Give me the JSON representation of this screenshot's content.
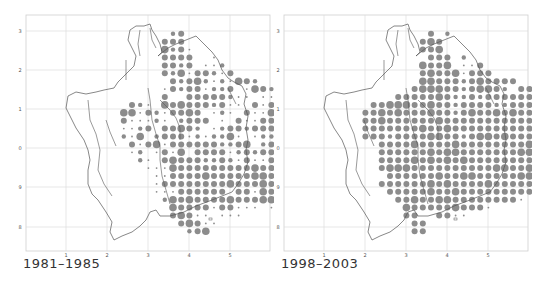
{
  "maps": [
    {
      "caption": "1981–1985",
      "x_ticks": [
        "1",
        "2",
        "3",
        "4",
        "5"
      ],
      "y_ticks": [
        "3",
        "2",
        "1",
        "0",
        "9",
        "8"
      ],
      "rows": [
        "00000000000000000000000000",
        "00000000000000000000000000",
        "0000000000000002300000000000",
        "0000000000000033300000000000",
        "00000000000000423100000000000",
        "00000000000000333300100000000",
        "000000000000003323011200000000",
        "0000000000000032413321300000000",
        "00000000000000032342121432000000",
        "0000000000000013233122301432200",
        "0000000000000030033333211011230",
        "000000000032104343332311031344221",
        "0000000004413213343012103114444",
        "0000000003111210233301031133334",
        "0000000001123033432012332333333",
        "0000000002140233312122410122333",
        "00000000003134133333322340233344",
        "00000000001201314033331232333332",
        "000000000002103433322321311332331",
        "000000000000111433333333343333343",
        "000000000000011333343333344343331",
        "000000000000013333333343334333331",
        "000000000000011133333303314333210",
        "000000000000002434333343334410000",
        "000000000000000433331331110100000",
        "000000000000000343110111000000000",
        "000000000000000034311000000000000",
        "000000000000000002340000000000000"
      ]
    },
    {
      "caption": "1998–2003",
      "x_ticks": [
        "1",
        "2",
        "3",
        "4",
        "5"
      ],
      "y_ticks": [
        "3",
        "2",
        "1",
        "0",
        "9",
        "8"
      ],
      "rows": [
        "00000000000000000000000000",
        "00000000000000000000000000",
        "0000000000000003020000000000",
        "0000000000000034300000000000",
        "00000000000000334000000000000",
        "00000000000000033302000000000",
        "000000000000004334011300000000",
        "0000000000000034334133300000000",
        "00000000000000443332343333000000",
        "0000000000000344433234432033000",
        "0000000000033333432232333333333",
        "000000003344433433233332233343343",
        "0000000334343334332343343433333",
        "0000000334333333433333333333334",
        "0000000333333343343333333333333",
        "0000000333233334433234434333333",
        "00000000033334333343333333343334",
        "00000000033333343443333333443433",
        "000000000333343434343333333333331",
        "000000000344433333333334433443343",
        "000000000033333343344333334433431",
        "000000000333333434333343333333331",
        "000000000033333433433333333333210",
        "000000000003343344333333331000000",
        "000000000000433333433310000000000",
        "000000000000330033110000000000000",
        "000000000000033000000000000000000",
        "000000000000033000000000000000000"
      ]
    }
  ],
  "colors": {
    "dot": "#8c8c8c",
    "outline": "#555555",
    "grid": "#dcdcdc",
    "frame": "#cfcfcf"
  }
}
